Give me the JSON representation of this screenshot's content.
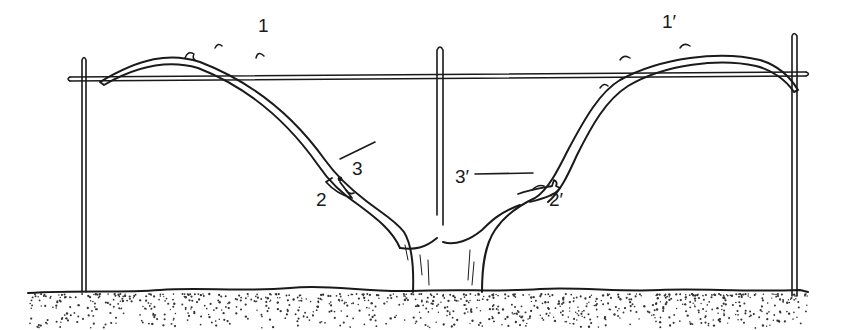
{
  "figure": {
    "colors": {
      "ink": "#1a1a1a",
      "background": "#ffffff",
      "soil_dots": "#333333"
    }
  },
  "labels": [
    {
      "id": "1",
      "text": "1",
      "x": 258,
      "y": 32
    },
    {
      "id": "1prime",
      "text": "1′",
      "x": 662,
      "y": 28
    },
    {
      "id": "3",
      "text": "3",
      "x": 352,
      "y": 175
    },
    {
      "id": "2",
      "text": "2",
      "x": 316,
      "y": 206
    },
    {
      "id": "3prime",
      "text": "3′",
      "x": 455,
      "y": 183
    },
    {
      "id": "2prime",
      "text": "2′",
      "x": 549,
      "y": 206
    }
  ],
  "parts": {
    "posts": [
      "left-post",
      "center-post",
      "right-post"
    ],
    "wire": "trellis-wire",
    "vine": [
      "trunk",
      "left-arm",
      "right-arm",
      "left-spur",
      "right-spur"
    ],
    "ground": "soil"
  }
}
